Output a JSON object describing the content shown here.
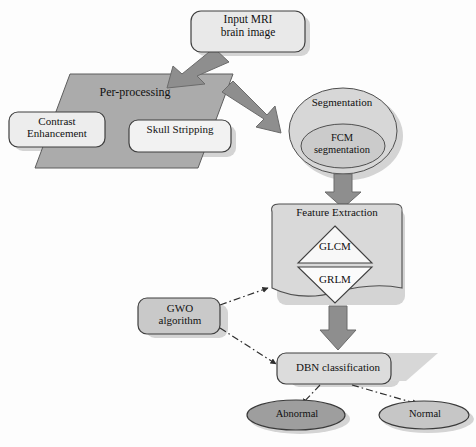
{
  "diagram": {
    "nodes": {
      "input": {
        "label": "Input MRI\nbrain image",
        "shape": "rounded-rect",
        "fill": "#e9e9e9"
      },
      "preprocessing": {
        "label": "Per-processing",
        "shape": "parallelogram",
        "fill": "#ababab"
      },
      "contrast": {
        "label": "Contrast\nEnhancement",
        "shape": "rounded-rect",
        "fill": "#ededed"
      },
      "skull": {
        "label": "Skull Stripping",
        "shape": "rounded-rect",
        "fill": "#f2f2f2"
      },
      "segmentation": {
        "label": "Segmentation",
        "shape": "ellipse",
        "fill": "#d7d7d7"
      },
      "fcm": {
        "label": "FCM\nsegmentation",
        "shape": "ellipse",
        "fill": "#cfcfcf"
      },
      "feature_extraction": {
        "label": "Feature Extraction",
        "shape": "document",
        "fill": "#d9d9d9"
      },
      "glcm": {
        "label": "GLCM",
        "shape": "triangle-up",
        "fill": "#f7f7f7"
      },
      "grlm": {
        "label": "GRLM",
        "shape": "triangle-down",
        "fill": "#fbfbfb"
      },
      "gwo": {
        "label": "GWO\nalgorithm",
        "shape": "rounded-rect",
        "fill": "#c9c9c9"
      },
      "dbn": {
        "label": "DBN classification",
        "shape": "rounded-rect",
        "fill": "#dcdcdc"
      },
      "abnormal": {
        "label": "Abnormal",
        "shape": "ellipse",
        "fill": "#9e9e9e"
      },
      "normal": {
        "label": "Normal",
        "shape": "ellipse",
        "fill": "#c6c6c6"
      }
    },
    "edges": [
      {
        "from": "input",
        "to": "preprocessing",
        "style": "block-arrow",
        "direction": "down-left"
      },
      {
        "from": "preprocessing",
        "to": "segmentation",
        "style": "block-arrow",
        "direction": "down-right"
      },
      {
        "from": "segmentation",
        "to": "feature_extraction",
        "style": "block-arrow",
        "direction": "down"
      },
      {
        "from": "feature_extraction",
        "to": "dbn",
        "style": "block-arrow",
        "direction": "down"
      },
      {
        "from": "gwo",
        "to": "feature_extraction",
        "style": "dash-dot",
        "direction": "up-right"
      },
      {
        "from": "gwo",
        "to": "dbn",
        "style": "dash-dot",
        "direction": "down-right"
      },
      {
        "from": "dbn",
        "to": "abnormal",
        "style": "dash-dot",
        "direction": "down-left"
      },
      {
        "from": "dbn",
        "to": "normal",
        "style": "dash-dot",
        "direction": "down-right"
      }
    ],
    "colors": {
      "arrow_fill": "#8e8e8e",
      "arrow_stroke": "#6f6f6f",
      "outline": "#4a4a4a",
      "dash_line": "#3a3a3a",
      "shadow": "#d0d0d0",
      "background": "#fdfdfd"
    }
  }
}
